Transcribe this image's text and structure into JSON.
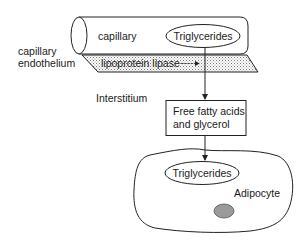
{
  "diagram": {
    "capillary": {
      "label": "capillary",
      "content_label": "Triglycerides"
    },
    "endothelium": {
      "label_line1": "capillary",
      "label_line2": "endothelium",
      "enzyme_label": "lipoprotein lipase"
    },
    "interstitium": {
      "label": "Interstitium"
    },
    "products": {
      "line1": "Free fatty acids",
      "line2": "and glycerol"
    },
    "adipocyte": {
      "label": "Adipocyte",
      "content_label": "Triglycerides"
    },
    "colors": {
      "line": "#222222",
      "shading": "#d0d0d0",
      "nucleus_fill": "#9a9a9a"
    }
  }
}
